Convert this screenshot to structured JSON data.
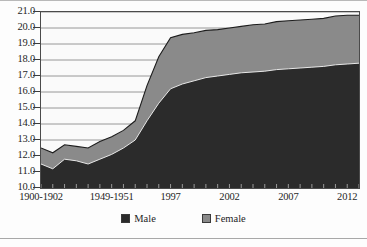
{
  "chart_data": {
    "type": "area",
    "stacked": true,
    "title": "",
    "xlabel": "",
    "ylabel": "",
    "ylim": [
      10.0,
      21.0
    ],
    "grid": true,
    "legend_position": "bottom",
    "y_ticks": [
      "21.0",
      "20.0",
      "19.0",
      "18.0",
      "17.0",
      "16.0",
      "15.0",
      "14.0",
      "13.0",
      "12.0",
      "11.0",
      "10.0"
    ],
    "x_tick_labels": [
      "1900-1902",
      "1949-1951",
      "1997",
      "2002",
      "2007",
      "2012"
    ],
    "x_tick_label_positions": [
      0,
      6,
      11,
      16,
      21,
      26
    ],
    "n_points": 28,
    "series": [
      {
        "name": "Male",
        "color": "#2b2b2b",
        "values": [
          11.5,
          11.2,
          11.8,
          11.7,
          11.5,
          11.8,
          12.1,
          12.5,
          13.0,
          14.2,
          15.3,
          16.2,
          16.5,
          16.7,
          16.9,
          17.0,
          17.1,
          17.2,
          17.25,
          17.3,
          17.4,
          17.45,
          17.5,
          17.55,
          17.6,
          17.7,
          17.75,
          17.8
        ]
      },
      {
        "name": "Female",
        "color": "#8a8a8a",
        "values": [
          1.0,
          1.0,
          0.9,
          0.9,
          1.0,
          1.1,
          1.1,
          1.1,
          1.2,
          2.2,
          2.9,
          3.2,
          3.1,
          3.0,
          2.95,
          2.9,
          2.9,
          2.9,
          2.95,
          2.95,
          3.0,
          3.0,
          3.0,
          3.0,
          3.0,
          3.05,
          3.05,
          3.0
        ]
      }
    ],
    "totals": [
      12.5,
      12.2,
      12.7,
      12.6,
      12.5,
      12.9,
      13.2,
      13.6,
      14.2,
      16.4,
      18.2,
      19.4,
      19.6,
      19.7,
      19.85,
      19.9,
      20.0,
      20.1,
      20.2,
      20.25,
      20.4,
      20.45,
      20.5,
      20.55,
      20.6,
      20.75,
      20.8,
      20.8
    ]
  },
  "legend": {
    "items": [
      {
        "label": "Male",
        "color": "#2b2b2b"
      },
      {
        "label": "Female",
        "color": "#8a8a8a"
      }
    ]
  },
  "caption": {
    "text": ""
  }
}
